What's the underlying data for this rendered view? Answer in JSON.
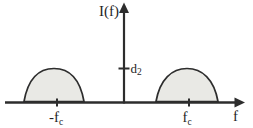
{
  "figure": {
    "y_axis_label": "I(f)",
    "x_axis_label": "f",
    "amplitude_tick_label": {
      "base": "d",
      "sub": "2"
    },
    "x_tick_labels": {
      "negative": {
        "base": "-f",
        "sub": "c"
      },
      "positive": {
        "base": "f",
        "sub": "c"
      }
    },
    "colors": {
      "background": "#ffffff",
      "line": "#2d2d2d",
      "text": "#1f1f1f",
      "lobe_fill": "#e9e9e5"
    }
  }
}
